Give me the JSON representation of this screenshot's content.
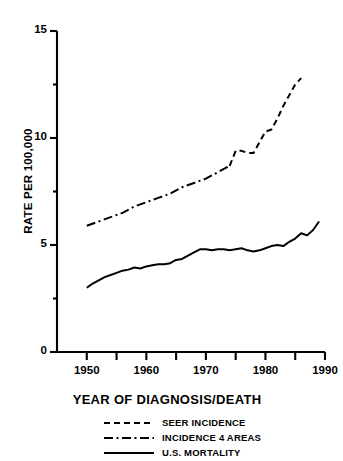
{
  "chart_data": {
    "type": "line",
    "title": "",
    "xlabel": "YEAR OF DIAGNOSIS/DEATH",
    "ylabel": "RATE PER 100,000",
    "xlim": [
      1945,
      1990
    ],
    "ylim": [
      0,
      15
    ],
    "xticks": [
      1950,
      1960,
      1970,
      1980,
      1990
    ],
    "xtick_labels": [
      "1950",
      "1960",
      "1970",
      "1980",
      "1990"
    ],
    "xminorticks": [
      1955,
      1965,
      1975,
      1985
    ],
    "yticks": [
      0,
      5,
      10,
      15
    ],
    "ytick_labels": [
      "0",
      "5",
      "10",
      "15"
    ],
    "grid": false,
    "legend_position": "below",
    "series": [
      {
        "name": "SEER INCIDENCE",
        "style": "dashed",
        "color": "#000000",
        "x": [
          1974,
          1975,
          1976,
          1977,
          1978,
          1979,
          1980,
          1981,
          1982,
          1983,
          1984,
          1985,
          1986
        ],
        "values": [
          8.7,
          9.4,
          9.4,
          9.3,
          9.3,
          9.8,
          10.3,
          10.4,
          10.9,
          11.5,
          12.0,
          12.5,
          12.8
        ]
      },
      {
        "name": "INCIDENCE 4 AREAS",
        "style": "dash-dot",
        "color": "#000000",
        "x": [
          1950,
          1952,
          1954,
          1956,
          1958,
          1960,
          1962,
          1964,
          1966,
          1968,
          1970,
          1972,
          1974
        ],
        "values": [
          5.9,
          6.1,
          6.3,
          6.5,
          6.8,
          7.0,
          7.2,
          7.4,
          7.7,
          7.9,
          8.1,
          8.4,
          8.7
        ]
      },
      {
        "name": "U.S. MORTALITY",
        "style": "solid",
        "color": "#000000",
        "x": [
          1950,
          1951,
          1952,
          1953,
          1954,
          1955,
          1956,
          1957,
          1958,
          1959,
          1960,
          1961,
          1962,
          1963,
          1964,
          1965,
          1966,
          1967,
          1968,
          1969,
          1970,
          1971,
          1972,
          1973,
          1974,
          1975,
          1976,
          1977,
          1978,
          1979,
          1980,
          1981,
          1982,
          1983,
          1984,
          1985,
          1986,
          1987,
          1988,
          1989
        ],
        "values": [
          3.0,
          3.2,
          3.35,
          3.5,
          3.6,
          3.7,
          3.8,
          3.85,
          3.95,
          3.9,
          4.0,
          4.05,
          4.1,
          4.1,
          4.15,
          4.3,
          4.35,
          4.5,
          4.65,
          4.8,
          4.8,
          4.75,
          4.8,
          4.8,
          4.75,
          4.8,
          4.85,
          4.75,
          4.7,
          4.75,
          4.85,
          4.95,
          5.0,
          4.95,
          5.15,
          5.3,
          5.55,
          5.45,
          5.7,
          6.1
        ]
      }
    ]
  },
  "y_axis": {
    "title": "RATE PER 100,000",
    "ticks": [
      {
        "label": "15",
        "value": 15
      },
      {
        "label": "10",
        "value": 10
      },
      {
        "label": "5",
        "value": 5
      },
      {
        "label": "0",
        "value": 0
      }
    ]
  },
  "x_axis": {
    "title": "YEAR OF DIAGNOSIS/DEATH",
    "ticks": [
      {
        "label": "1950",
        "value": 1950
      },
      {
        "label": "1960",
        "value": 1960
      },
      {
        "label": "1970",
        "value": 1970
      },
      {
        "label": "1980",
        "value": 1980
      },
      {
        "label": "1990",
        "value": 1990
      }
    ]
  },
  "legend": {
    "entries": [
      {
        "label": "SEER INCIDENCE",
        "style": "dashed"
      },
      {
        "label": "INCIDENCE 4 AREAS",
        "style": "dash-dot"
      },
      {
        "label": "U.S. MORTALITY",
        "style": "solid"
      }
    ]
  },
  "colors": {
    "ink": "#000000",
    "background": "#ffffff"
  }
}
